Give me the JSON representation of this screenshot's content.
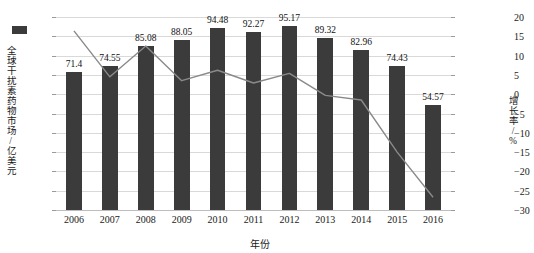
{
  "chart_data": {
    "type": "bar",
    "title": "",
    "xlabel": "年份",
    "ylabel": "全球干扰素药物市场/亿美元",
    "y2label": "增长率/%",
    "categories": [
      "2006",
      "2007",
      "2008",
      "2009",
      "2010",
      "2011",
      "2012",
      "2013",
      "2014",
      "2015",
      "2016"
    ],
    "ylim": [
      0,
      100
    ],
    "y2lim": [
      -30,
      20
    ],
    "yticks": [
      "100",
      "90",
      "80",
      "70",
      "60",
      "50",
      "40",
      "30",
      "20",
      "10",
      "0"
    ],
    "ytick_values": [
      100,
      90,
      80,
      70,
      60,
      50,
      40,
      30,
      20,
      10,
      0
    ],
    "y2ticks": [
      "20",
      "15",
      "10",
      "5",
      "0",
      "−5",
      "−10",
      "−15",
      "−20",
      "−25",
      "−30"
    ],
    "y2tick_values": [
      20,
      15,
      10,
      5,
      0,
      -5,
      -10,
      -15,
      -20,
      -25,
      -30
    ],
    "grid": true,
    "legend": "none",
    "series": [
      {
        "name": "全球干扰素药物市场",
        "type": "bar",
        "axis": "left",
        "color": "#3b3b3b",
        "values": [
          71.4,
          74.55,
          85.08,
          88.05,
          94.48,
          92.27,
          95.17,
          89.32,
          82.96,
          74.43,
          54.57
        ],
        "labels": [
          "71.4",
          "74.55",
          "85.08",
          "88.05",
          "94.48",
          "92.27",
          "95.17",
          "89.32",
          "82.96",
          "74.43",
          "54.57"
        ]
      },
      {
        "name": "增长率",
        "type": "line",
        "axis": "right",
        "color": "#8a8a8a",
        "values": [
          16.4,
          4.5,
          12.5,
          3.5,
          6.2,
          2.9,
          5.4,
          -0.3,
          -1.5,
          -15.0,
          -26.7
        ]
      }
    ]
  },
  "legend_swatch": {
    "name": "bar-series-swatch",
    "color": "#3b3b3b"
  }
}
